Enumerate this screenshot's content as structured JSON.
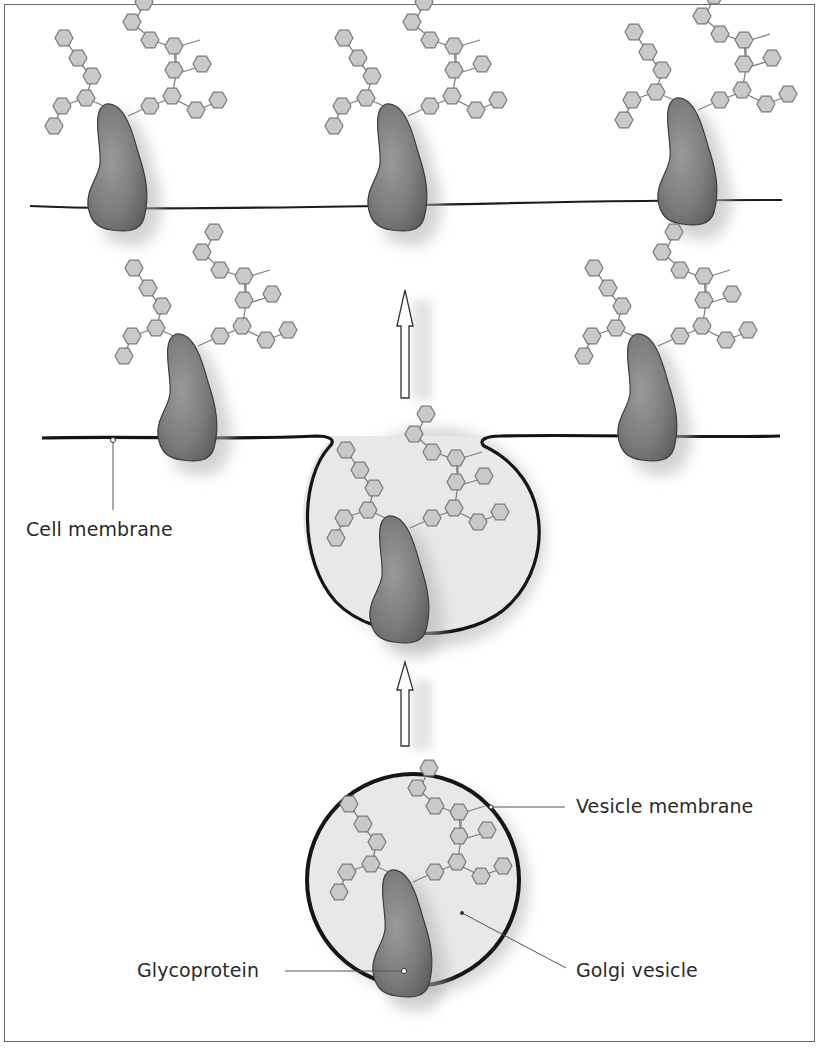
{
  "figure": {
    "labels": {
      "cell_membrane": "Cell membrane",
      "vesicle_membrane": "Vesicle membrane",
      "glycoprotein": "Glycoprotein",
      "golgi_vesicle": "Golgi vesicle"
    },
    "stages": [
      {
        "name": "golgi-vesicle-stage",
        "description": "Glycoprotein inside Golgi vesicle"
      },
      {
        "name": "fusion-stage",
        "description": "Vesicle fusing with cell membrane"
      },
      {
        "name": "surface-stage",
        "description": "Glycoproteins displayed on cell surface"
      }
    ],
    "arrows": [
      "up-arrow-lower",
      "up-arrow-upper"
    ],
    "colors": {
      "protein": "#7a7a7a",
      "sugar_fill": "#c8c8c8",
      "sugar_stroke": "#7a7a7a",
      "membrane": "#1c1c1c",
      "vesicle_fill": "#e6e6e6",
      "frame": "#6a6a6a"
    }
  }
}
